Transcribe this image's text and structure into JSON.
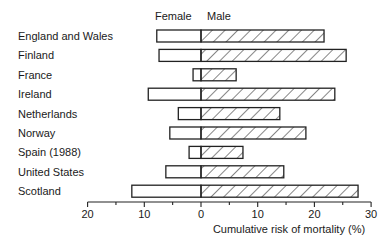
{
  "chart_data": {
    "type": "bar",
    "orientation": "horizontal",
    "layout": "back-to-back (population pyramid style)",
    "title": "",
    "xlabel": "Cumulative risk of mortality (%)",
    "ylabel": "",
    "xlim": [
      -20,
      30
    ],
    "xticks": [
      20,
      10,
      0,
      10,
      20,
      30
    ],
    "minor_tick_step": 5,
    "grid": false,
    "legend": {
      "position": "top",
      "entries": [
        "Female",
        "Male"
      ]
    },
    "categories": [
      "England and Wales",
      "Finland",
      "France",
      "Ireland",
      "Netherlands",
      "Norway",
      "Spain (1988)",
      "United States",
      "Scotland"
    ],
    "series": [
      {
        "name": "Female",
        "side": "left",
        "fill": "white",
        "values": [
          7.8,
          7.4,
          1.4,
          9.3,
          4.0,
          5.5,
          2.1,
          6.2,
          12.2
        ]
      },
      {
        "name": "Male",
        "side": "right",
        "fill": "hatched",
        "values": [
          21.7,
          25.6,
          6.2,
          23.6,
          13.9,
          18.5,
          7.4,
          14.6,
          27.7
        ]
      }
    ]
  },
  "legend": {
    "female": "Female",
    "male": "Male"
  },
  "axis": {
    "xlabel": "Cumulative risk of mortality (%)",
    "tick_labels": [
      "20",
      "10",
      "0",
      "10",
      "20",
      "30"
    ]
  }
}
